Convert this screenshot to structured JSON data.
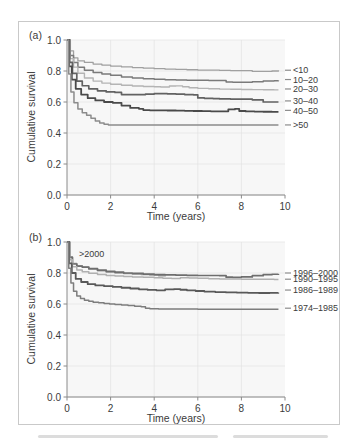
{
  "figure": {
    "panels": [
      {
        "id": "a",
        "label": "(a)",
        "ylabel": "Cumulative survival",
        "xlabel": "Time (years)",
        "inline_annotation": ""
      },
      {
        "id": "b",
        "label": "(b)",
        "ylabel": "Cumulative survival",
        "xlabel": "Time (years)",
        "inline_annotation": ">2000"
      }
    ],
    "axis": {
      "x_ticks": [
        "0",
        "2",
        "4",
        "6",
        "8",
        "10"
      ],
      "y_ticks": [
        "0.0",
        "0.2",
        "0.4",
        "0.6",
        "0.8",
        "1.0"
      ]
    },
    "colors": {
      "grid": "#e2e2e2",
      "axis": "#8a8a8a",
      "plot_background": "#f7f7f7",
      "frame": "#c9c9c9",
      "text": "#3b3b3b"
    }
  },
  "chart_data": [
    {
      "type": "line",
      "panel": "a",
      "title": "(a)",
      "xlabel": "Time (years)",
      "ylabel": "Cumulative survival",
      "xlim": [
        0,
        10
      ],
      "ylim": [
        0,
        1
      ],
      "xticks": [
        0,
        2,
        4,
        6,
        8,
        10
      ],
      "yticks": [
        0.0,
        0.2,
        0.4,
        0.6,
        0.8,
        1.0
      ],
      "grid": true,
      "legend": "right-inline-labels",
      "series": [
        {
          "name": "<10",
          "color": "#a0a0a0",
          "width": 1.3,
          "x": [
            0,
            0.15,
            0.3,
            0.5,
            0.8,
            1.2,
            1.6,
            2.0,
            2.5,
            3.0,
            3.5,
            4.0,
            4.5,
            5.0,
            5.5,
            6.0,
            6.5,
            7.0,
            7.5,
            8.0,
            8.5,
            9.0,
            9.4,
            9.7
          ],
          "y": [
            1.0,
            0.93,
            0.885,
            0.865,
            0.855,
            0.845,
            0.838,
            0.832,
            0.826,
            0.822,
            0.818,
            0.815,
            0.812,
            0.81,
            0.808,
            0.806,
            0.805,
            0.804,
            0.803,
            0.802,
            0.797,
            0.797,
            0.8,
            0.805
          ]
        },
        {
          "name": "10–20",
          "color": "#7a7a7a",
          "width": 1.5,
          "x": [
            0,
            0.15,
            0.3,
            0.5,
            0.8,
            1.2,
            1.6,
            2.0,
            2.5,
            3.0,
            3.5,
            4.0,
            4.5,
            5.0,
            5.5,
            6.0,
            6.5,
            7.0,
            7.3,
            7.6,
            8.0,
            8.5,
            9.0,
            9.5,
            9.7
          ],
          "y": [
            1.0,
            0.9,
            0.855,
            0.825,
            0.805,
            0.79,
            0.78,
            0.772,
            0.762,
            0.755,
            0.75,
            0.747,
            0.744,
            0.742,
            0.741,
            0.74,
            0.739,
            0.738,
            0.729,
            0.728,
            0.728,
            0.731,
            0.735,
            0.737,
            0.738
          ]
        },
        {
          "name": "20–30",
          "color": "#b4b4b4",
          "width": 1.4,
          "x": [
            0,
            0.15,
            0.3,
            0.5,
            0.8,
            1.2,
            1.6,
            2.0,
            2.5,
            3.0,
            3.5,
            4.0,
            4.3,
            4.7,
            5.0,
            5.3,
            5.6,
            6.0,
            6.5,
            7.0,
            7.5,
            8.0,
            8.5,
            9.0,
            9.5,
            9.7
          ],
          "y": [
            1.0,
            0.88,
            0.825,
            0.785,
            0.755,
            0.735,
            0.722,
            0.715,
            0.708,
            0.703,
            0.7,
            0.698,
            0.697,
            0.703,
            0.704,
            0.698,
            0.692,
            0.688,
            0.685,
            0.683,
            0.682,
            0.681,
            0.68,
            0.679,
            0.678,
            0.678
          ]
        },
        {
          "name": "30–40",
          "color": "#626262",
          "width": 1.7,
          "x": [
            0,
            0.12,
            0.25,
            0.45,
            0.7,
            1.0,
            1.4,
            1.8,
            2.2,
            2.5,
            2.8,
            3.2,
            3.6,
            4.0,
            4.3,
            4.6,
            5.0,
            5.4,
            5.8,
            6.0,
            6.3,
            6.7,
            7.0,
            7.5,
            8.0,
            8.5,
            9.0,
            9.5,
            9.7
          ],
          "y": [
            1.0,
            0.855,
            0.785,
            0.735,
            0.705,
            0.685,
            0.672,
            0.665,
            0.662,
            0.648,
            0.648,
            0.648,
            0.651,
            0.654,
            0.654,
            0.653,
            0.651,
            0.648,
            0.646,
            0.626,
            0.624,
            0.622,
            0.62,
            0.619,
            0.618,
            0.614,
            0.6,
            0.6,
            0.6
          ]
        },
        {
          "name": "40–50",
          "color": "#4a4a4a",
          "width": 1.8,
          "x": [
            0,
            0.1,
            0.22,
            0.4,
            0.65,
            0.95,
            1.3,
            1.7,
            2.1,
            2.5,
            2.9,
            3.3,
            3.5,
            3.8,
            4.2,
            4.6,
            5.0,
            5.4,
            5.8,
            6.2,
            6.6,
            7.0,
            7.4,
            7.7,
            7.9,
            8.2,
            8.6,
            9.0,
            9.4,
            9.7
          ],
          "y": [
            1.0,
            0.83,
            0.745,
            0.685,
            0.648,
            0.625,
            0.61,
            0.6,
            0.595,
            0.577,
            0.562,
            0.556,
            0.548,
            0.546,
            0.546,
            0.545,
            0.544,
            0.543,
            0.542,
            0.541,
            0.54,
            0.54,
            0.552,
            0.556,
            0.542,
            0.539,
            0.538,
            0.537,
            0.536,
            0.536
          ]
        },
        {
          "name": ">50",
          "color": "#8c8c8c",
          "width": 1.5,
          "x": [
            0,
            0.08,
            0.18,
            0.32,
            0.5,
            0.7,
            0.9,
            1.1,
            1.3,
            1.5,
            1.7,
            1.9,
            2.2,
            3.0,
            4.0,
            5.0,
            6.0,
            7.0,
            8.0,
            9.0,
            9.5,
            9.7
          ],
          "y": [
            1.0,
            0.78,
            0.665,
            0.595,
            0.555,
            0.53,
            0.515,
            0.495,
            0.478,
            0.465,
            0.456,
            0.452,
            0.452,
            0.452,
            0.452,
            0.452,
            0.452,
            0.452,
            0.452,
            0.452,
            0.452,
            0.452
          ]
        }
      ],
      "labels": [
        "<10",
        "10–20",
        "20–30",
        "30–40",
        "40–50",
        ">50"
      ]
    },
    {
      "type": "line",
      "panel": "b",
      "title": "(b)",
      "xlabel": "Time (years)",
      "ylabel": "Cumulative survival",
      "xlim": [
        0,
        10
      ],
      "ylim": [
        0,
        1
      ],
      "xticks": [
        0,
        2,
        4,
        6,
        8,
        10
      ],
      "yticks": [
        0.0,
        0.2,
        0.4,
        0.6,
        0.8,
        1.0
      ],
      "grid": true,
      "legend": "right-inline-labels",
      "annotations": [
        {
          "text": ">2000",
          "x": 0.55,
          "y": 0.955
        }
      ],
      "series": [
        {
          "name": ">2000",
          "color": "#9a9a9a",
          "width": 1.4,
          "truncated_at_x": 4.5,
          "x": [
            0,
            0.12,
            0.25,
            0.45,
            0.7,
            1.0,
            1.4,
            1.8,
            2.2,
            2.6,
            3.0,
            3.4,
            3.8,
            4.2,
            4.5
          ],
          "y": [
            1.0,
            0.905,
            0.862,
            0.845,
            0.838,
            0.826,
            0.815,
            0.806,
            0.8,
            0.796,
            0.793,
            0.79,
            0.786,
            0.782,
            0.778
          ]
        },
        {
          "name": "1996–2000",
          "color": "#6e6e6e",
          "width": 1.7,
          "x": [
            0,
            0.12,
            0.25,
            0.45,
            0.7,
            1.0,
            1.4,
            1.8,
            2.2,
            2.6,
            3.0,
            3.5,
            4.0,
            4.5,
            5.0,
            5.5,
            6.0,
            6.5,
            7.0,
            7.3,
            7.6,
            8.0,
            8.5,
            9.0,
            9.4,
            9.7
          ],
          "y": [
            1.0,
            0.9,
            0.858,
            0.845,
            0.838,
            0.828,
            0.818,
            0.81,
            0.805,
            0.8,
            0.797,
            0.793,
            0.79,
            0.788,
            0.786,
            0.785,
            0.784,
            0.784,
            0.783,
            0.773,
            0.772,
            0.775,
            0.783,
            0.789,
            0.792,
            0.793
          ]
        },
        {
          "name": "1990–1995",
          "color": "#b0b0b0",
          "width": 1.5,
          "x": [
            0,
            0.12,
            0.25,
            0.45,
            0.7,
            1.0,
            1.4,
            1.8,
            2.2,
            2.6,
            3.0,
            3.5,
            4.0,
            4.4,
            4.8,
            5.2,
            5.6,
            6.0,
            6.5,
            7.0,
            7.5,
            8.0,
            8.5,
            9.0,
            9.5,
            9.7
          ],
          "y": [
            1.0,
            0.885,
            0.84,
            0.82,
            0.808,
            0.798,
            0.79,
            0.784,
            0.78,
            0.777,
            0.775,
            0.772,
            0.77,
            0.766,
            0.764,
            0.769,
            0.768,
            0.766,
            0.763,
            0.762,
            0.761,
            0.76,
            0.76,
            0.759,
            0.758,
            0.758
          ]
        },
        {
          "name": "1986–1989",
          "color": "#595959",
          "width": 1.8,
          "x": [
            0,
            0.1,
            0.22,
            0.4,
            0.65,
            0.95,
            1.3,
            1.7,
            2.1,
            2.5,
            2.9,
            3.3,
            3.7,
            4.1,
            4.5,
            4.9,
            5.2,
            5.5,
            5.9,
            6.3,
            6.8,
            7.3,
            7.8,
            8.3,
            8.8,
            9.3,
            9.7
          ],
          "y": [
            1.0,
            0.862,
            0.8,
            0.762,
            0.742,
            0.728,
            0.72,
            0.715,
            0.71,
            0.705,
            0.7,
            0.695,
            0.691,
            0.688,
            0.694,
            0.696,
            0.692,
            0.688,
            0.684,
            0.68,
            0.677,
            0.675,
            0.673,
            0.672,
            0.671,
            0.672,
            0.673
          ]
        },
        {
          "name": "1974–1985",
          "color": "#7d7d7d",
          "width": 1.5,
          "x": [
            0,
            0.08,
            0.18,
            0.3,
            0.45,
            0.62,
            0.8,
            1.0,
            1.2,
            1.45,
            1.7,
            1.95,
            2.2,
            2.5,
            2.8,
            3.1,
            3.4,
            3.6,
            3.8,
            4.2,
            5.0,
            6.0,
            7.0,
            8.0,
            9.0,
            9.7
          ],
          "y": [
            1.0,
            0.83,
            0.735,
            0.682,
            0.652,
            0.635,
            0.625,
            0.618,
            0.612,
            0.608,
            0.604,
            0.6,
            0.597,
            0.594,
            0.59,
            0.586,
            0.582,
            0.572,
            0.57,
            0.568,
            0.567,
            0.566,
            0.566,
            0.566,
            0.566,
            0.566
          ]
        }
      ],
      "labels": [
        "1996–2000",
        "1990–1995",
        "1986–1989",
        "1974–1985"
      ]
    }
  ]
}
